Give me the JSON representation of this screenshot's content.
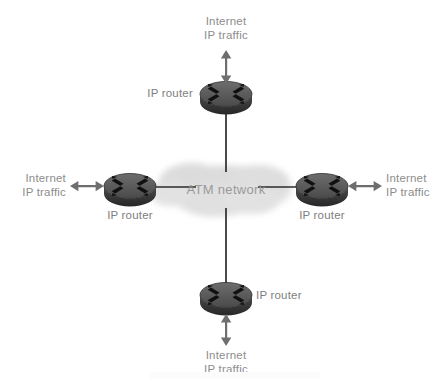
{
  "diagram": {
    "cloud": {
      "label": "ATM network",
      "color": "#d9d9d9"
    },
    "colors": {
      "router_top": "#5c5c5c",
      "router_side": "#3a3a3a",
      "router_glyph": "#111111",
      "link_line": "#2b2b2b",
      "arrow": "#6e6e6e",
      "text": "#8a8a8a",
      "background": "#ffffff"
    },
    "nodes": [
      {
        "id": "router-north",
        "label": "IP router",
        "label_position": "left",
        "traffic_label_line1": "Internet",
        "traffic_label_line2": "IP traffic",
        "traffic_direction": "up",
        "arrow_type": "double-headed-vertical"
      },
      {
        "id": "router-west",
        "label": "IP router",
        "label_position": "below",
        "traffic_label_line1": "Internet",
        "traffic_label_line2": "IP traffic",
        "traffic_direction": "left",
        "arrow_type": "double-headed-horizontal"
      },
      {
        "id": "router-east",
        "label": "IP router",
        "label_position": "below",
        "traffic_label_line1": "Internet",
        "traffic_label_line2": "IP traffic",
        "traffic_direction": "right",
        "arrow_type": "double-headed-horizontal"
      },
      {
        "id": "router-south",
        "label": "IP router",
        "label_position": "right",
        "traffic_label_line1": "Internet",
        "traffic_label_line2": "IP traffic",
        "traffic_direction": "down",
        "arrow_type": "double-headed-vertical"
      }
    ]
  }
}
